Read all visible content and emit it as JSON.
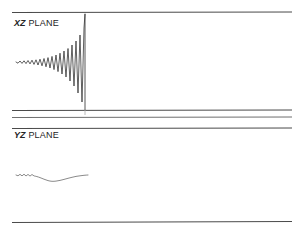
{
  "figure": {
    "background_color": "#ffffff",
    "ink_color": "#2b2b2b",
    "rule_color": "#4a4a4a"
  },
  "panels": [
    {
      "id": "xz",
      "label_axis": "XZ",
      "label_word": "PLANE",
      "label_full": "XZ PLANE"
    },
    {
      "id": "yz",
      "label_axis": "YZ",
      "label_word": "PLANE",
      "label_full": "YZ PLANE"
    }
  ],
  "chart_data": [
    {
      "type": "line",
      "id": "xz-trace",
      "title": "XZ PLANE",
      "xlabel": "",
      "ylabel": "",
      "grid": false,
      "legend": null,
      "baseline_y": 62,
      "xlim": [
        12,
        292
      ],
      "description": "Exponentially growing oscillatory chirp terminating in a sharp vertical arrival spike.",
      "annotations": [
        {
          "name": "arrival-spike",
          "x": 85,
          "y_top": 14,
          "y_bottom": 110
        }
      ],
      "x": [
        16,
        18,
        20,
        22,
        24,
        26,
        28,
        30,
        32,
        34,
        36,
        38,
        40,
        42,
        44,
        46,
        48,
        50,
        52,
        54,
        56,
        58,
        60,
        62,
        64,
        66,
        68,
        70,
        72,
        74,
        76,
        78,
        80,
        82,
        84,
        85
      ],
      "values": [
        0,
        -1.2,
        1.0,
        -1.4,
        1.2,
        -1.6,
        1.5,
        -1.9,
        1.8,
        -2.4,
        2.2,
        -3.0,
        2.8,
        -3.8,
        3.5,
        -4.8,
        4.4,
        -6.0,
        5.6,
        -7.6,
        7.0,
        -9.6,
        8.8,
        -12.0,
        11.0,
        -15.0,
        13.5,
        -19.0,
        17.0,
        -24.0,
        21.0,
        -31.0,
        27.0,
        -40.0,
        34.0,
        48.0
      ]
    },
    {
      "type": "line",
      "id": "yz-trace",
      "title": "YZ PLANE",
      "xlabel": "",
      "ylabel": "",
      "grid": false,
      "legend": null,
      "baseline_y": 175,
      "xlim": [
        12,
        292
      ],
      "description": "Low-amplitude ripples followed by a single shallow broad trough.",
      "annotations": [
        {
          "name": "trough-minimum",
          "x": 52,
          "y": 182
        }
      ],
      "x": [
        16,
        18,
        20,
        22,
        24,
        26,
        28,
        30,
        32,
        34,
        37,
        40,
        44,
        48,
        52,
        56,
        60,
        64,
        68,
        72,
        76,
        80,
        84,
        88
      ],
      "values": [
        0,
        -0.8,
        0.7,
        -0.9,
        0.8,
        -1.0,
        0.6,
        -1.1,
        0.5,
        -0.9,
        -1.6,
        -2.6,
        -4.2,
        -5.6,
        -6.3,
        -6.1,
        -5.4,
        -4.4,
        -3.3,
        -2.3,
        -1.4,
        -0.8,
        -0.3,
        0
      ]
    }
  ]
}
